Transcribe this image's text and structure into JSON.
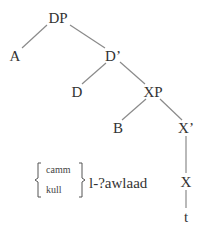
{
  "diagram": {
    "type": "syntax-tree",
    "nodes": {
      "dp": {
        "label": "DP",
        "x": 58,
        "y": 18
      },
      "a": {
        "label": "A",
        "x": 15,
        "y": 56
      },
      "d_bar": {
        "label": "D’",
        "x": 113,
        "y": 56
      },
      "d": {
        "label": "D",
        "x": 77,
        "y": 92
      },
      "xp": {
        "label": "XP",
        "x": 153,
        "y": 92
      },
      "b": {
        "label": "B",
        "x": 118,
        "y": 128
      },
      "x_bar": {
        "label": "X’",
        "x": 186,
        "y": 128
      },
      "x": {
        "label": "X",
        "x": 186,
        "y": 182
      },
      "t": {
        "label": "t",
        "x": 186,
        "y": 217
      }
    },
    "edges": [
      [
        "dp",
        "a"
      ],
      [
        "dp",
        "d_bar"
      ],
      [
        "d_bar",
        "d"
      ],
      [
        "d_bar",
        "xp"
      ],
      [
        "xp",
        "b"
      ],
      [
        "xp",
        "x_bar"
      ],
      [
        "x_bar",
        "x"
      ],
      [
        "x",
        "t"
      ]
    ],
    "bracket_options": {
      "top": "camm",
      "bottom": "kull"
    },
    "phrase": "l-?awlaad",
    "colors": {
      "text": "#333333",
      "line": "#8a8a8a",
      "background": "#ffffff"
    }
  }
}
